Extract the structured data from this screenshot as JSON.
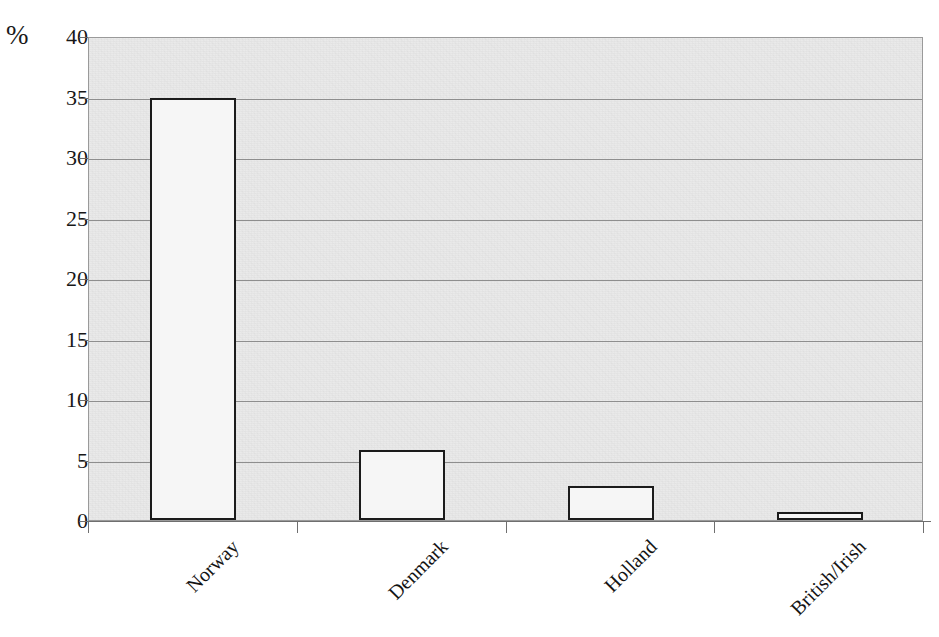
{
  "chart_data": {
    "type": "bar",
    "title": "",
    "xlabel": "",
    "ylabel": "%",
    "ylim": [
      0,
      40
    ],
    "ytick_step": 5,
    "yticks": [
      40,
      35,
      30,
      25,
      20,
      15,
      10,
      5,
      0
    ],
    "categories": [
      "Norway",
      "Denmark",
      "Holland",
      "British/Irish"
    ],
    "values": [
      34.9,
      5.8,
      2.8,
      0.7
    ],
    "grid": "horizontal",
    "legend": "none",
    "colors": {
      "bar_fill": "#f6f6f6",
      "bar_border": "#1b1b1b",
      "plot_background": "#e9e9e9",
      "gridline": "#8e8e8e",
      "text": "#141414"
    }
  },
  "axis": {
    "unit_label": "%"
  }
}
